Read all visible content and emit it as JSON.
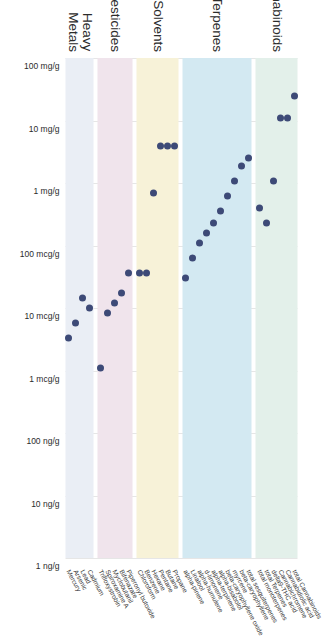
{
  "chart_data": {
    "type": "scatter",
    "title": "",
    "xlabel": "",
    "ylabel": "",
    "orientation": "rotated-90",
    "grid": true,
    "legend": "none",
    "x_axis": {
      "scale": "log-descending",
      "ticks": [
        "100 mg/g",
        "10 mg/g",
        "1 mg/g",
        "100 mcg/g",
        "10 mcg/g",
        "1 mcg/g",
        "100 ng/g",
        "10 ng/g",
        "1 ng/g"
      ],
      "tick_fractions": [
        0.0,
        0.125,
        0.25,
        0.375,
        0.5,
        0.625,
        0.75,
        0.875,
        1.0
      ]
    },
    "dot_color": "#3d4a77",
    "grid_color": "#e6e6e6",
    "groups": [
      {
        "name": "Cannabinoids",
        "band_color": "#e3f0ea",
        "points": [
          {
            "label": "total Cannabinoids",
            "x_frac": 0.075
          },
          {
            "label": "Cannabidiolic acid",
            "x_frac": 0.12
          },
          {
            "label": "Cannabichromene",
            "x_frac": 0.12
          },
          {
            "label": "delta9-THC acid",
            "x_frac": 0.245
          },
          {
            "label": "total Terpenes",
            "x_frac": 0.33
          },
          {
            "label": "total monoterpenes",
            "x_frac": 0.3
          }
        ]
      },
      {
        "name": "Terpenes",
        "band_color": "#d3e9f2",
        "points": [
          {
            "label": "total sesquiterpenes",
            "x_frac": 0.2
          },
          {
            "label": "beta-caryophyllene",
            "x_frac": 0.215
          },
          {
            "label": "myrcene",
            "x_frac": 0.245
          },
          {
            "label": "beta-caryophyllene oxide",
            "x_frac": 0.275
          },
          {
            "label": "alpha-bisabolol",
            "x_frac": 0.305
          },
          {
            "label": "alpha-terpinene",
            "x_frac": 0.33
          },
          {
            "label": "d-limonene",
            "x_frac": 0.35
          },
          {
            "label": "alpha-humulene",
            "x_frac": 0.37
          },
          {
            "label": "Linalool",
            "x_frac": 0.4
          },
          {
            "label": "alpha-pinene",
            "x_frac": 0.44
          }
        ]
      },
      {
        "name": "Residual Solvents",
        "band_color": "#f7f2d8",
        "points": [
          {
            "label": "Propane",
            "x_frac": 0.175
          },
          {
            "label": "Butane",
            "x_frac": 0.175
          },
          {
            "label": "Pentane",
            "x_frac": 0.175
          },
          {
            "label": "Hexane",
            "x_frac": 0.27
          },
          {
            "label": "Benzene",
            "x_frac": 0.43
          },
          {
            "label": "Chloroform",
            "x_frac": 0.43
          }
        ]
      },
      {
        "name": "Pesticides",
        "band_color": "#f0e4ec",
        "points": [
          {
            "label": "Piperonyl butoxide",
            "x_frac": 0.43
          },
          {
            "label": "Bifenazate",
            "x_frac": 0.47
          },
          {
            "label": "Myclobutanil",
            "x_frac": 0.49
          },
          {
            "label": "Spiroxamine A",
            "x_frac": 0.51
          },
          {
            "label": "Trifloxystrobin",
            "x_frac": 0.62
          }
        ]
      },
      {
        "name": "Heavy\nMetals",
        "band_color": "#eaeef5",
        "points": [
          {
            "label": "Cadmium",
            "x_frac": 0.5
          },
          {
            "label": "Lead",
            "x_frac": 0.48
          },
          {
            "label": "Arsenic",
            "x_frac": 0.53
          },
          {
            "label": "Mercury",
            "x_frac": 0.56
          }
        ]
      }
    ]
  }
}
